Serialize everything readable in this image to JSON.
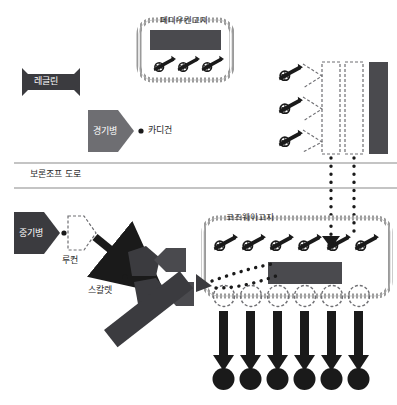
{
  "map": {
    "title": "발라클라바 전투 배치도",
    "width": 397,
    "height": 405,
    "background": "#ffffff"
  },
  "colors": {
    "dark_unit": "#3b3b3f",
    "mid_unit": "#6e6e72",
    "black": "#1a1a1a",
    "line": "#8a8a8a",
    "hatch": "#9a9a9a",
    "text_dark": "#2b2b2b",
    "text_light": "#ffffff",
    "bar_dark": "#4a4a4e"
  },
  "labels": {
    "redoubt_upper": "페디우킨고지",
    "raglan": "레글린",
    "light_brigade": "경기병",
    "cardigan": "카디건",
    "vorontsov_road": "보론조프 도로",
    "heavy_brigade": "중기병",
    "lucan": "루컨",
    "scarlett": "스칼렛",
    "camp": "더랴비예 야영지",
    "causeway_heights": "코즈웨이고지"
  },
  "icons": {
    "cannon": "cannon-icon",
    "unit_marker": "unit-marker-icon",
    "arrow_down": "arrow-down-icon",
    "dot_path": "dotted-path-icon",
    "bullet": "bullet-dot-icon"
  },
  "features": {
    "upper_redoubt": {
      "name": "페디우킨고지",
      "cannon_count": 3,
      "has_dark_bar": true,
      "border": "hatched-rounded"
    },
    "causeway_redoubt": {
      "name": "코즈웨이고지",
      "cannon_count": 6,
      "has_dark_bar": true,
      "circle_count": 6,
      "border": "hatched-rounded"
    },
    "right_battery": {
      "cannon_count": 3,
      "dashed_columns": 2,
      "solid_bar": true
    },
    "charge_arrows": {
      "count": 6,
      "direction": "down",
      "terminator": "filled-circle"
    },
    "road": {
      "name": "보론조프 도로",
      "lines": 2
    },
    "scarlett_units": {
      "count": 4,
      "shape": "pentagon"
    }
  }
}
